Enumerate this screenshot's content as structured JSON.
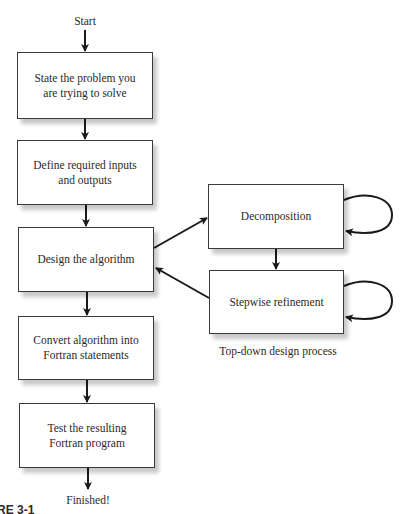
{
  "diagram": {
    "type": "flowchart",
    "start_label": "Start",
    "end_label": "Finished!",
    "main_steps": [
      {
        "id": "step1",
        "label": "State the problem you are trying to solve",
        "lines": [
          "State the problem you",
          "are trying to solve"
        ]
      },
      {
        "id": "step2",
        "label": "Define required inputs and outputs",
        "lines": [
          "Define required inputs",
          "and outputs"
        ]
      },
      {
        "id": "step3",
        "label": "Design the algorithm",
        "lines": [
          "Design the algorithm"
        ]
      },
      {
        "id": "step4",
        "label": "Convert algorithm into Fortran statements",
        "lines": [
          "Convert algorithm into",
          "Fortran statements"
        ]
      },
      {
        "id": "step5",
        "label": "Test the resulting Fortran program",
        "lines": [
          "Test the resulting",
          "Fortran program"
        ]
      }
    ],
    "subprocess": {
      "caption": "Top-down design process",
      "steps": [
        {
          "id": "sub1",
          "label": "Decomposition",
          "self_loop": true
        },
        {
          "id": "sub2",
          "label": "Stepwise refinement",
          "self_loop": true
        }
      ]
    },
    "edges": [
      {
        "from": "start",
        "to": "step1"
      },
      {
        "from": "step1",
        "to": "step2"
      },
      {
        "from": "step2",
        "to": "step3"
      },
      {
        "from": "step3",
        "to": "sub1"
      },
      {
        "from": "sub1",
        "to": "sub1"
      },
      {
        "from": "sub1",
        "to": "sub2"
      },
      {
        "from": "sub2",
        "to": "sub2"
      },
      {
        "from": "sub2",
        "to": "step3"
      },
      {
        "from": "step3",
        "to": "step4"
      },
      {
        "from": "step4",
        "to": "step5"
      },
      {
        "from": "step5",
        "to": "end"
      }
    ],
    "figure_label_fragment": "RE 3-1"
  }
}
